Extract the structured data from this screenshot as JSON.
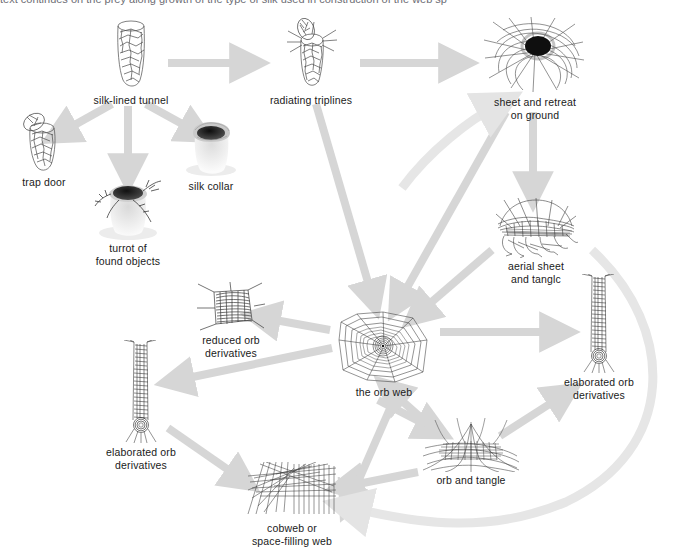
{
  "figure": {
    "background_color": "#ffffff",
    "arrow_color": "#d9d9d9",
    "arrow_color_light": "#e6e6e6",
    "ink_color": "#333333",
    "text_color": "#1a1a1a",
    "cropped_top_text": "text continues on the prey along growth of the type        of silk used in construction of the web       sp"
  },
  "nodes": [
    {
      "id": "silk-lined-tunnel",
      "label": "silk-lined tunnel",
      "art": "tunnel",
      "x": 92,
      "y": 18,
      "w": 78,
      "h": 78
    },
    {
      "id": "radiating-triplines",
      "label": "radiating triplines",
      "art": "triplines",
      "x": 268,
      "y": 18,
      "w": 86,
      "h": 78
    },
    {
      "id": "sheet-and-retreat",
      "label": "sheet and retreat\non ground",
      "art": "sheet-retreat",
      "x": 480,
      "y": 16,
      "w": 110,
      "h": 78
    },
    {
      "id": "trap-door",
      "label": "trap door",
      "art": "trapdoor",
      "x": 8,
      "y": 112,
      "w": 72,
      "h": 66
    },
    {
      "id": "turret-found-objects",
      "label": "turrot of\nfound objects",
      "art": "turret",
      "x": 80,
      "y": 178,
      "w": 84,
      "h": 62
    },
    {
      "id": "silk-collar",
      "label": "silk collar",
      "art": "collar",
      "x": 176,
      "y": 120,
      "w": 70,
      "h": 62
    },
    {
      "id": "aerial-sheet-tangle",
      "label": "aerial sheet\nand tanglc",
      "art": "aerial-sheet",
      "x": 488,
      "y": 196,
      "w": 96,
      "h": 70
    },
    {
      "id": "reduced-orb",
      "label": "reduced orb\nderivatives",
      "art": "reduced-orb",
      "x": 190,
      "y": 282,
      "w": 82,
      "h": 60
    },
    {
      "id": "the-orb-web",
      "label": "the orb web",
      "art": "orb",
      "x": 336,
      "y": 310,
      "w": 96,
      "h": 84
    },
    {
      "id": "elaborated-orb-right",
      "label": "elaborated orb\nderivatives",
      "art": "ladder",
      "x": 566,
      "y": 274,
      "w": 66,
      "h": 110
    },
    {
      "id": "elaborated-orb-left",
      "label": "elaborated orb\nderivatives",
      "art": "ladder",
      "x": 108,
      "y": 340,
      "w": 66,
      "h": 114
    },
    {
      "id": "orb-and-tangle",
      "label": "orb and tangle",
      "art": "orb-tangle",
      "x": 418,
      "y": 418,
      "w": 106,
      "h": 66
    },
    {
      "id": "cobweb",
      "label": "cobweb or\nspace-filling web",
      "art": "cobweb",
      "x": 243,
      "y": 462,
      "w": 98,
      "h": 62
    }
  ],
  "edges": [
    {
      "id": "e1",
      "from": "silk-lined-tunnel",
      "to": "radiating-triplines",
      "style": "straight"
    },
    {
      "id": "e2",
      "from": "radiating-triplines",
      "to": "sheet-and-retreat",
      "style": "straight"
    },
    {
      "id": "e3",
      "from": "silk-lined-tunnel",
      "to": "trap-door",
      "style": "straight"
    },
    {
      "id": "e4",
      "from": "silk-lined-tunnel",
      "to": "turret-found-objects",
      "style": "straight"
    },
    {
      "id": "e5",
      "from": "silk-lined-tunnel",
      "to": "silk-collar",
      "style": "straight"
    },
    {
      "id": "e6",
      "from": "sheet-and-retreat",
      "to": "aerial-sheet-tangle",
      "style": "straight"
    },
    {
      "id": "e7",
      "from": "sheet-and-retreat",
      "to": "the-orb-web",
      "style": "straight"
    },
    {
      "id": "e8",
      "from": "aerial-sheet-tangle",
      "to": "the-orb-web",
      "style": "straight"
    },
    {
      "id": "e9",
      "from": "radiating-triplines",
      "to": "the-orb-web",
      "style": "straight"
    },
    {
      "id": "e10",
      "from": "the-orb-web",
      "to": "reduced-orb",
      "style": "straight"
    },
    {
      "id": "e11",
      "from": "the-orb-web",
      "to": "elaborated-orb-left",
      "style": "straight"
    },
    {
      "id": "e12",
      "from": "the-orb-web",
      "to": "elaborated-orb-right",
      "style": "straight"
    },
    {
      "id": "e13",
      "from": "the-orb-web",
      "to": "orb-and-tangle",
      "style": "straight"
    },
    {
      "id": "e14",
      "from": "orb-and-tangle",
      "to": "the-orb-web",
      "style": "straight"
    },
    {
      "id": "e15",
      "from": "orb-and-tangle",
      "to": "elaborated-orb-right",
      "style": "straight"
    },
    {
      "id": "e16",
      "from": "orb-and-tangle",
      "to": "cobweb",
      "style": "straight"
    },
    {
      "id": "e17",
      "from": "elaborated-orb-left",
      "to": "cobweb",
      "style": "straight"
    },
    {
      "id": "e18",
      "from": "aerial-sheet-tangle",
      "to": "cobweb",
      "style": "curved"
    },
    {
      "id": "e19",
      "from": "the-orb-web",
      "to": "cobweb",
      "style": "straight"
    },
    {
      "id": "e20",
      "from": "aerial-sheet-tangle",
      "to": "sheet-and-retreat",
      "style": "curved"
    }
  ]
}
